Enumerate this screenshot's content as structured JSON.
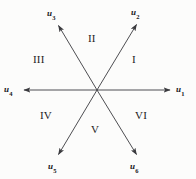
{
  "figure": {
    "type": "vector-sector-diagram",
    "background_color": "#fcfcfb",
    "line_color": "#3a3a3e",
    "text_color": "#17171a",
    "center": {
      "x": 97,
      "y": 90
    },
    "vector_count": 6,
    "sector_count": 6,
    "angle_step_degrees": 60
  },
  "vectors": [
    {
      "id": "u1",
      "base": "u",
      "subscript": "1",
      "angle_degrees": 0,
      "tip": {
        "x": 172,
        "y": 90
      },
      "label_pos": {
        "x": 176,
        "y": 85
      }
    },
    {
      "id": "u2",
      "base": "u",
      "subscript": "2",
      "angle_degrees": 60,
      "tip": {
        "x": 138,
        "y": 22
      },
      "label_pos": {
        "x": 131,
        "y": 8
      }
    },
    {
      "id": "u3",
      "base": "u",
      "subscript": "3",
      "angle_degrees": 120,
      "tip": {
        "x": 57,
        "y": 23
      },
      "label_pos": {
        "x": 47,
        "y": 9
      }
    },
    {
      "id": "u4",
      "base": "u",
      "subscript": "4",
      "angle_degrees": 180,
      "tip": {
        "x": 22,
        "y": 90
      },
      "label_pos": {
        "x": 4,
        "y": 85
      }
    },
    {
      "id": "u5",
      "base": "u",
      "subscript": "5",
      "angle_degrees": 240,
      "tip": {
        "x": 57,
        "y": 157
      },
      "label_pos": {
        "x": 48,
        "y": 162
      }
    },
    {
      "id": "u6",
      "base": "u",
      "subscript": "6",
      "angle_degrees": 300,
      "tip": {
        "x": 138,
        "y": 157
      },
      "label_pos": {
        "x": 130,
        "y": 162
      }
    }
  ],
  "sectors": [
    {
      "id": "sector-1",
      "label": "I",
      "pos": {
        "x": 132,
        "y": 54
      }
    },
    {
      "id": "sector-2",
      "label": "II",
      "pos": {
        "x": 88,
        "y": 33
      }
    },
    {
      "id": "sector-3",
      "label": "III",
      "pos": {
        "x": 33,
        "y": 54
      }
    },
    {
      "id": "sector-4",
      "label": "IV",
      "pos": {
        "x": 40,
        "y": 110
      }
    },
    {
      "id": "sector-5",
      "label": "V",
      "pos": {
        "x": 91,
        "y": 124
      }
    },
    {
      "id": "sector-6",
      "label": "VI",
      "pos": {
        "x": 135,
        "y": 110
      }
    }
  ]
}
